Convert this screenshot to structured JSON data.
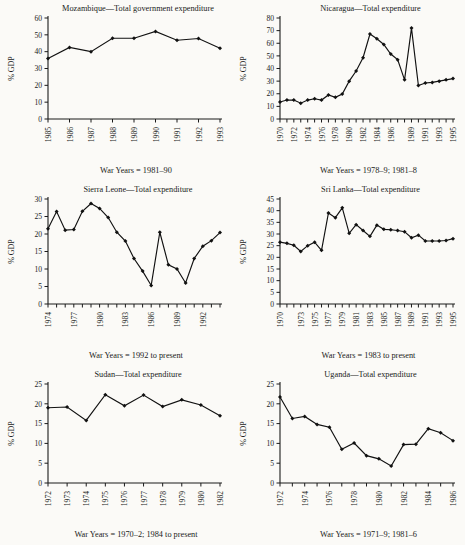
{
  "figure": {
    "background": "#fbfaf7",
    "ink": "#1a1a1a",
    "panel_count": 6
  },
  "chart_data": [
    {
      "id": "mozambique",
      "type": "line",
      "title": "Mozambique—Total government expenditure",
      "caption": "War Years = 1981–90",
      "ylabel": "% GDP",
      "xlabel": "",
      "ylim": [
        0,
        60
      ],
      "yticks": [
        0,
        10,
        20,
        30,
        40,
        50,
        60
      ],
      "grid": false,
      "legend": "none",
      "x": [
        1985,
        1986,
        1987,
        1988,
        1989,
        1990,
        1991,
        1992,
        1993
      ],
      "xtick_labels": [
        "1985",
        "1986",
        "1987",
        "1988",
        "1989",
        "1990",
        "1991",
        "1992",
        "1993"
      ],
      "values": [
        36,
        42.5,
        40,
        48,
        48,
        52,
        46.8,
        47.8,
        42
      ]
    },
    {
      "id": "nicaragua",
      "type": "line",
      "title": "Nicaragua—Total expenditure",
      "caption": "War Years = 1978–9; 1981–8",
      "ylabel": "% GDP",
      "xlabel": "",
      "ylim": [
        0,
        80
      ],
      "yticks": [
        0,
        10,
        20,
        30,
        40,
        50,
        60,
        70,
        80
      ],
      "grid": false,
      "legend": "none",
      "x": [
        1970,
        1971,
        1972,
        1973,
        1974,
        1975,
        1976,
        1977,
        1978,
        1979,
        1980,
        1981,
        1982,
        1983,
        1984,
        1985,
        1986,
        1987,
        1988,
        1989,
        1990,
        1991,
        1992,
        1993,
        1994,
        1995
      ],
      "xtick_labels": [
        "1970",
        "",
        "1972",
        "",
        "1974",
        "",
        "1976",
        "",
        "1978",
        "",
        "1980",
        "",
        "1982",
        "",
        "1984",
        "",
        "1986",
        "",
        "",
        "1989",
        "",
        "1991",
        "",
        "1993",
        "",
        "1995"
      ],
      "values": [
        13.5,
        15,
        15,
        12.5,
        15,
        16,
        15,
        19,
        17.2,
        19.8,
        30,
        38,
        48.5,
        67.3,
        63.5,
        59,
        51.5,
        47,
        31,
        72,
        26.5,
        28.5,
        29,
        30,
        31,
        32
      ]
    },
    {
      "id": "sierra-leone",
      "type": "line",
      "title": "Sierra Leone—Total expenditure",
      "caption": "War Years = 1992 to present",
      "ylabel": "% GDP",
      "xlabel": "",
      "ylim": [
        0,
        30
      ],
      "yticks": [
        0,
        5,
        10,
        15,
        20,
        25,
        30
      ],
      "grid": false,
      "legend": "none",
      "x": [
        1974,
        1975,
        1976,
        1977,
        1978,
        1979,
        1980,
        1981,
        1982,
        1983,
        1984,
        1985,
        1986,
        1987,
        1988,
        1989,
        1990,
        1991,
        1992,
        1993,
        1994
      ],
      "xtick_labels": [
        "1974",
        "",
        "",
        "1977",
        "",
        "",
        "1980",
        "",
        "",
        "1983",
        "",
        "",
        "1986",
        "",
        "",
        "1989",
        "",
        "",
        "1992",
        "",
        ""
      ],
      "values": [
        21.5,
        26.4,
        21.1,
        21.3,
        26.5,
        28.7,
        27.3,
        24.7,
        20.5,
        18,
        13,
        9.4,
        5.3,
        20.5,
        11.2,
        10,
        6,
        13,
        16.5,
        18.1,
        20.4
      ]
    },
    {
      "id": "sri-lanka",
      "type": "line",
      "title": "Sri Lanka—Total expenditure",
      "caption": "War Years = 1983 to present",
      "ylabel": "% GDP",
      "xlabel": "",
      "ylim": [
        0,
        45
      ],
      "yticks": [
        0,
        5,
        10,
        15,
        20,
        25,
        30,
        35,
        40,
        45
      ],
      "grid": false,
      "legend": "none",
      "x": [
        1970,
        1971,
        1972,
        1973,
        1974,
        1975,
        1976,
        1977,
        1978,
        1979,
        1980,
        1981,
        1982,
        1983,
        1984,
        1985,
        1986,
        1987,
        1988,
        1989,
        1990,
        1991,
        1992,
        1993,
        1994,
        1995
      ],
      "xtick_labels": [
        "1970",
        "",
        "",
        "1973",
        "",
        "1975",
        "",
        "1977",
        "",
        "1979",
        "",
        "1981",
        "",
        "1983",
        "",
        "1985",
        "",
        "1987",
        "",
        "1989",
        "",
        "1991",
        "",
        "1993",
        "",
        "1995"
      ],
      "values": [
        26.5,
        26,
        25.2,
        22.5,
        25,
        26.5,
        23,
        39,
        37,
        41.2,
        30.3,
        34,
        31.5,
        29,
        33.8,
        32,
        31.8,
        31.5,
        31,
        28.4,
        29.5,
        27,
        27,
        27,
        27.2,
        28
      ]
    },
    {
      "id": "sudan",
      "type": "line",
      "title": "Sudan—Total expenditure",
      "caption": "War Years = 1970–2; 1984 to present",
      "ylabel": "% GDP",
      "xlabel": "",
      "ylim": [
        0,
        25
      ],
      "yticks": [
        0,
        5,
        10,
        15,
        20,
        25
      ],
      "grid": false,
      "legend": "none",
      "x": [
        1972,
        1973,
        1974,
        1975,
        1976,
        1977,
        1978,
        1979,
        1980,
        1982
      ],
      "xtick_labels": [
        "1972",
        "1973",
        "1974",
        "1975",
        "1976",
        "1977",
        "1978",
        "1979",
        "1980",
        "1982"
      ],
      "values": [
        19,
        19.2,
        15.8,
        22.3,
        19.5,
        22.2,
        19.3,
        21,
        19.7,
        17
      ]
    },
    {
      "id": "uganda",
      "type": "line",
      "title": "Uganda—Total expenditure",
      "caption": "War Years = 1971–9; 1981–6",
      "ylabel": "% GDP",
      "xlabel": "",
      "ylim": [
        0,
        25
      ],
      "yticks": [
        0,
        5,
        10,
        15,
        20,
        25
      ],
      "grid": false,
      "legend": "none",
      "x": [
        1972,
        1973,
        1974,
        1975,
        1976,
        1977,
        1978,
        1979,
        1980,
        1981,
        1982,
        1983,
        1984,
        1985,
        1986
      ],
      "xtick_labels": [
        "1972",
        "",
        "1974",
        "",
        "1976",
        "",
        "1978",
        "",
        "1980",
        "",
        "1982",
        "",
        "1984",
        "",
        "1986"
      ],
      "values": [
        21.7,
        16.3,
        16.8,
        14.8,
        14.1,
        8.5,
        10.1,
        6.9,
        6.1,
        4.3,
        9.7,
        9.8,
        13.7,
        12.7,
        10.7
      ]
    }
  ]
}
